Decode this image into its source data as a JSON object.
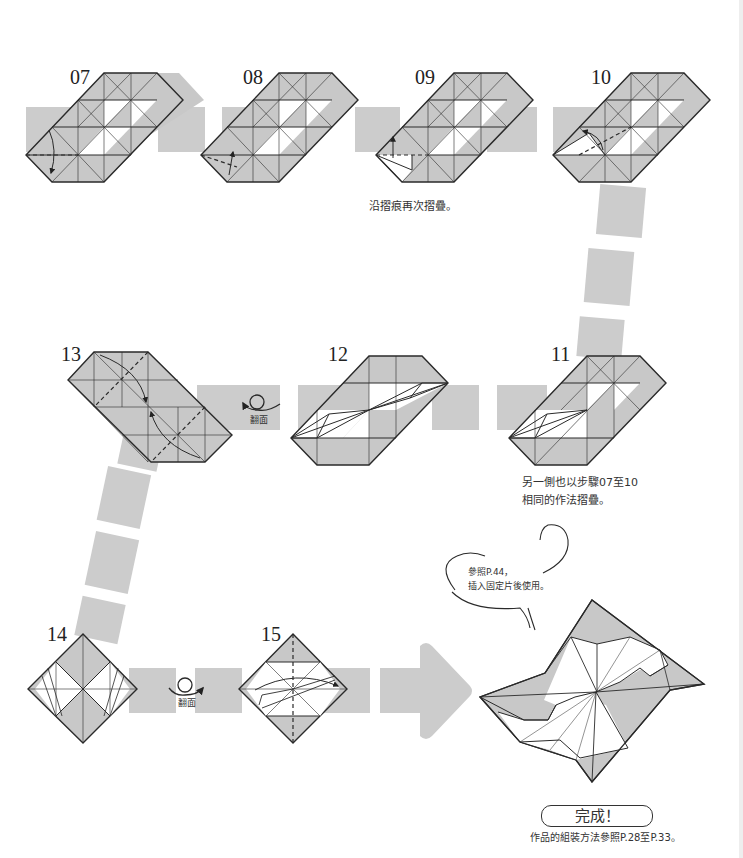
{
  "page": {
    "colors": {
      "paper_gray": "#c8c8c8",
      "connector_gray": "#cccccc",
      "line": "#2a2a2a",
      "background": "#ffffff"
    }
  },
  "steps": [
    {
      "number": "07",
      "note": ""
    },
    {
      "number": "08",
      "note": ""
    },
    {
      "number": "09",
      "note": "沿摺痕再次摺疊。"
    },
    {
      "number": "10",
      "note": ""
    },
    {
      "number": "11",
      "note_lines": [
        "另一側也以步驟07至10",
        "相同的作法摺疊。"
      ]
    },
    {
      "number": "12",
      "note": ""
    },
    {
      "number": "13",
      "note": ""
    },
    {
      "number": "14",
      "note": ""
    },
    {
      "number": "15",
      "note": ""
    }
  ],
  "flip_icons": [
    {
      "label": "翻面",
      "between": "13-12"
    },
    {
      "label": "翻面",
      "between": "14-15"
    }
  ],
  "speech_bubble": {
    "lines": [
      "參照P.44，",
      "插入固定片後使用。"
    ]
  },
  "completion": {
    "badge": "完成！",
    "caption": "作品的組裝方法參照P.28至P.33。"
  }
}
